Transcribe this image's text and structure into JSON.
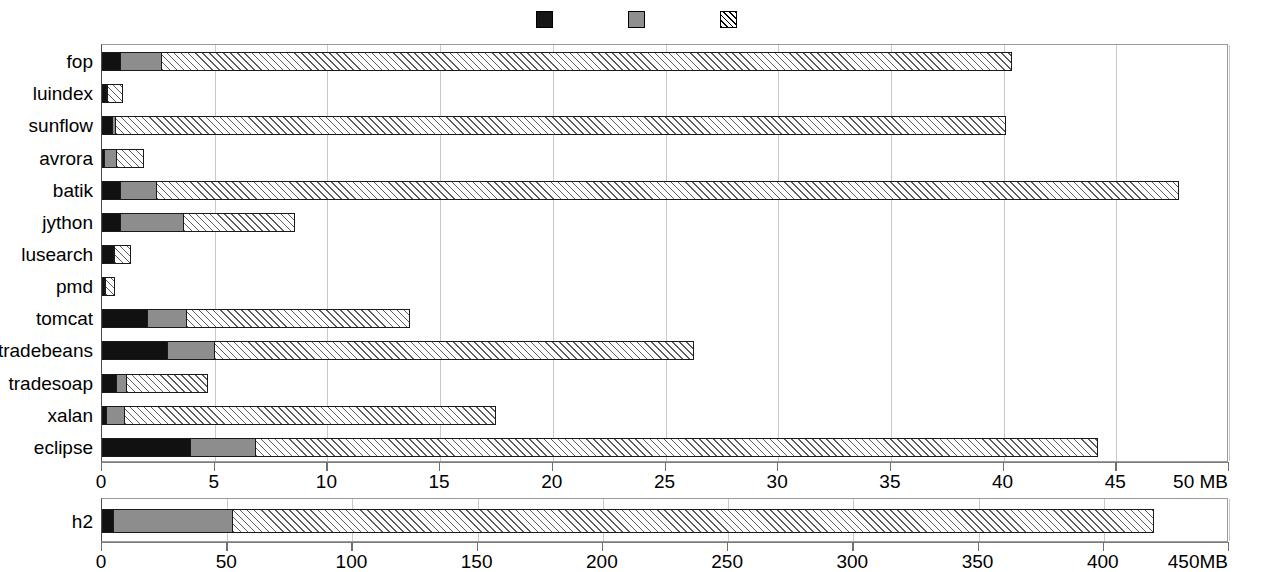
{
  "legend": {
    "items": [
      {
        "label": "Live char[] objects with common values",
        "swatch": "black-swatch-icon"
      },
      {
        "label": "Other live char[] objects",
        "swatch": "gray-swatch-icon"
      },
      {
        "label": "Other live objects",
        "swatch": "hatched-swatch-icon"
      }
    ]
  },
  "chart_data": [
    {
      "id": "main",
      "type": "bar",
      "orientation": "horizontal",
      "stacked": true,
      "title": "",
      "xlabel": "MB",
      "ylabel": "",
      "xlim": [
        0,
        50
      ],
      "xticks": [
        0,
        5,
        10,
        15,
        20,
        25,
        30,
        35,
        40,
        45,
        50
      ],
      "xticklabels": [
        "0",
        "5",
        "10",
        "15",
        "20",
        "25",
        "30",
        "35",
        "40",
        "45",
        "50 MB"
      ],
      "grid": true,
      "legend_position": "top",
      "categories": [
        "fop",
        "luindex",
        "sunflow",
        "avrora",
        "batik",
        "jython",
        "lusearch",
        "pmd",
        "tomcat",
        "tradebeans",
        "tradesoap",
        "xalan",
        "eclipse"
      ],
      "series": [
        {
          "name": "Live char[] objects with common values",
          "color": "#111111",
          "values": [
            0.85,
            0.25,
            0.5,
            0.15,
            0.85,
            0.85,
            0.55,
            0.15,
            2.05,
            2.95,
            0.7,
            0.25,
            3.95
          ]
        },
        {
          "name": "Other live char[] objects",
          "color": "#8d8d8d",
          "values": [
            1.9,
            0.1,
            0.2,
            0.6,
            1.65,
            2.85,
            0.1,
            0.05,
            1.8,
            2.15,
            0.5,
            0.85,
            2.95
          ]
        },
        {
          "name": "Other live objects",
          "color": "#ffffff",
          "values": [
            37.75,
            0.7,
            39.5,
            1.25,
            45.4,
            5.0,
            0.75,
            0.45,
            9.95,
            21.3,
            3.6,
            16.5,
            37.4
          ]
        }
      ],
      "totals": [
        40.5,
        1.05,
        40.2,
        2.0,
        47.9,
        8.7,
        1.4,
        0.65,
        13.8,
        26.4,
        4.8,
        17.6,
        44.3
      ]
    },
    {
      "id": "h2",
      "type": "bar",
      "orientation": "horizontal",
      "stacked": true,
      "title": "",
      "xlabel": "MB",
      "ylabel": "",
      "xlim": [
        0,
        450
      ],
      "xticks": [
        0,
        50,
        100,
        150,
        200,
        250,
        300,
        350,
        400,
        450
      ],
      "xticklabels": [
        "0",
        "50",
        "100",
        "150",
        "200",
        "250",
        "300",
        "350",
        "400",
        "450MB"
      ],
      "grid": true,
      "categories": [
        "h2"
      ],
      "series": [
        {
          "name": "Live char[] objects with common values",
          "color": "#111111",
          "values": [
            4.8
          ]
        },
        {
          "name": "Other live char[] objects",
          "color": "#8d8d8d",
          "values": [
            48.2
          ]
        },
        {
          "name": "Other live objects",
          "color": "#ffffff",
          "values": [
            368.0
          ]
        }
      ],
      "totals": [
        421.0
      ]
    }
  ]
}
